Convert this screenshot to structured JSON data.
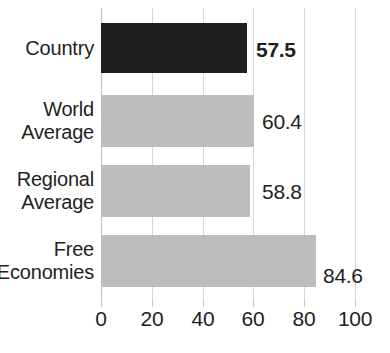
{
  "chart_data": {
    "type": "bar",
    "orientation": "horizontal",
    "title": "",
    "xlabel": "",
    "ylabel": "",
    "xlim": [
      0,
      100
    ],
    "grid": true,
    "legend": "none",
    "categories": [
      "Country",
      "World Average",
      "Regional Average",
      "Free Economies"
    ],
    "values": [
      57.5,
      60.4,
      58.8,
      84.6
    ],
    "value_labels": [
      "57.5",
      "60.4",
      "58.8",
      "84.6"
    ],
    "xticks": [
      0,
      20,
      40,
      60,
      80,
      100
    ],
    "xtick_labels": [
      "0",
      "20",
      "40",
      "60",
      "80",
      "100"
    ],
    "bars": [
      {
        "category": "Country",
        "label_lines": [
          "Country"
        ],
        "value": 57.5,
        "value_label": "57.5",
        "color": "#1f1f1f",
        "emphasis": true
      },
      {
        "category": "World Average",
        "label_lines": [
          "World",
          "Average"
        ],
        "value": 60.4,
        "value_label": "60.4",
        "color": "#bdbdbd",
        "emphasis": false
      },
      {
        "category": "Regional Average",
        "label_lines": [
          "Regional",
          "Average"
        ],
        "value": 58.8,
        "value_label": "58.8",
        "color": "#bdbdbd",
        "emphasis": false
      },
      {
        "category": "Free Economies",
        "label_lines": [
          "Free",
          "Economies"
        ],
        "value": 84.6,
        "value_label": "84.6",
        "color": "#bdbdbd",
        "emphasis": false
      }
    ],
    "colors": {
      "highlight_bar": "#1f1f1f",
      "default_bar": "#bdbdbd",
      "gridline": "#d6d6d6",
      "axis": "#bfbfbf",
      "text": "#231f20",
      "background": "#ffffff"
    }
  }
}
